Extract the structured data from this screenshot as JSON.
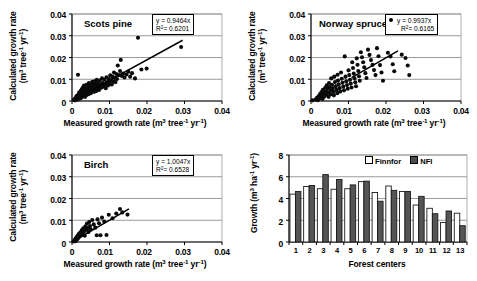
{
  "figure": {
    "panels": [
      "scots-pine",
      "norway-spruce",
      "birch",
      "forest-centers"
    ]
  },
  "common": {
    "xlabel_main": "Measured growth rate (m",
    "ylabel_line1": "Calculated growth rate",
    "ylabel_line2": "(m",
    "x_ticks": [
      "0",
      "0.01",
      "0.02",
      "0.03",
      "0.04"
    ],
    "y_ticks": [
      "0",
      "0.01",
      "0.02",
      "0.03",
      "0.04"
    ]
  },
  "chart_data": [
    {
      "type": "scatter",
      "name": "scots-pine",
      "title": "Scots pine",
      "xlabel": "Measured growth rate (m³ tree⁻¹ yr⁻¹)",
      "ylabel": "Calculated growth rate (m³ tree⁻¹ yr⁻¹)",
      "xlim": [
        0,
        0.04
      ],
      "ylim": [
        0,
        0.04
      ],
      "xticks": [
        0,
        0.01,
        0.02,
        0.03,
        0.04
      ],
      "yticks": [
        0,
        0.01,
        0.02,
        0.03,
        0.04
      ],
      "grid": true,
      "annotation": {
        "equation": "y  = 0.9464x",
        "r2": "R² = 0.6201",
        "marker": "none"
      },
      "fit_line": {
        "slope": 0.9464,
        "intercept": 0,
        "x_start": 0.0055,
        "x_end": 0.0295
      },
      "points": [
        [
          0.0005,
          0.0005
        ],
        [
          0.0007,
          0.0009
        ],
        [
          0.0008,
          0.0003
        ],
        [
          0.0009,
          0.0012
        ],
        [
          0.001,
          0.0006
        ],
        [
          0.0011,
          0.0018
        ],
        [
          0.0012,
          0.0009
        ],
        [
          0.0013,
          0.0024
        ],
        [
          0.0014,
          0.0014
        ],
        [
          0.0015,
          0.0007
        ],
        [
          0.0016,
          0.0121
        ],
        [
          0.0017,
          0.0029
        ],
        [
          0.0018,
          0.0017
        ],
        [
          0.0019,
          0.0039
        ],
        [
          0.002,
          0.0022
        ],
        [
          0.0021,
          0.0011
        ],
        [
          0.0022,
          0.0033
        ],
        [
          0.0023,
          0.0046
        ],
        [
          0.0024,
          0.0026
        ],
        [
          0.0025,
          0.0015
        ],
        [
          0.0026,
          0.0054
        ],
        [
          0.0027,
          0.0036
        ],
        [
          0.0028,
          0.0021
        ],
        [
          0.0029,
          0.0062
        ],
        [
          0.003,
          0.0043
        ],
        [
          0.0031,
          0.0028
        ],
        [
          0.0032,
          0.0071
        ],
        [
          0.0033,
          0.0051
        ],
        [
          0.0034,
          0.0034
        ],
        [
          0.0035,
          0.0019
        ],
        [
          0.0036,
          0.0061
        ],
        [
          0.0037,
          0.0044
        ],
        [
          0.0038,
          0.0027
        ],
        [
          0.0039,
          0.0075
        ],
        [
          0.004,
          0.0054
        ],
        [
          0.0041,
          0.0038
        ],
        [
          0.0042,
          0.0065
        ],
        [
          0.0043,
          0.0047
        ],
        [
          0.0044,
          0.0031
        ],
        [
          0.0045,
          0.0082
        ],
        [
          0.0046,
          0.0058
        ],
        [
          0.0047,
          0.0041
        ],
        [
          0.0048,
          0.0069
        ],
        [
          0.0049,
          0.0051
        ],
        [
          0.005,
          0.0036
        ],
        [
          0.0051,
          0.0076
        ],
        [
          0.0052,
          0.0057
        ],
        [
          0.0053,
          0.0044
        ],
        [
          0.0054,
          0.0088
        ],
        [
          0.0055,
          0.0064
        ],
        [
          0.0056,
          0.0049
        ],
        [
          0.0057,
          0.0079
        ],
        [
          0.0058,
          0.0059
        ],
        [
          0.0059,
          0.0042
        ],
        [
          0.006,
          0.0091
        ],
        [
          0.0061,
          0.0068
        ],
        [
          0.0062,
          0.0052
        ],
        [
          0.0063,
          0.0083
        ],
        [
          0.0064,
          0.0062
        ],
        [
          0.0065,
          0.0046
        ],
        [
          0.0066,
          0.0097
        ],
        [
          0.0067,
          0.0073
        ],
        [
          0.0068,
          0.0056
        ],
        [
          0.0069,
          0.0086
        ],
        [
          0.007,
          0.0066
        ],
        [
          0.0072,
          0.0051
        ],
        [
          0.0074,
          0.0094
        ],
        [
          0.0076,
          0.0077
        ],
        [
          0.0078,
          0.0061
        ],
        [
          0.008,
          0.0104
        ],
        [
          0.0082,
          0.0082
        ],
        [
          0.0084,
          0.0067
        ],
        [
          0.0086,
          0.0098
        ],
        [
          0.0088,
          0.0076
        ],
        [
          0.009,
          0.0059
        ],
        [
          0.0092,
          0.0109
        ],
        [
          0.0094,
          0.0087
        ],
        [
          0.0096,
          0.0071
        ],
        [
          0.0098,
          0.0102
        ],
        [
          0.01,
          0.0081
        ],
        [
          0.0102,
          0.0118
        ],
        [
          0.0104,
          0.0094
        ],
        [
          0.0106,
          0.0076
        ],
        [
          0.0108,
          0.0112
        ],
        [
          0.011,
          0.0089
        ],
        [
          0.0112,
          0.0131
        ],
        [
          0.0114,
          0.0106
        ],
        [
          0.0116,
          0.0087
        ],
        [
          0.0118,
          0.0124
        ],
        [
          0.012,
          0.0101
        ],
        [
          0.0122,
          0.0163
        ],
        [
          0.0125,
          0.0119
        ],
        [
          0.0128,
          0.0138
        ],
        [
          0.013,
          0.0189
        ],
        [
          0.0133,
          0.0115
        ],
        [
          0.0136,
          0.0126
        ],
        [
          0.014,
          0.0108
        ],
        [
          0.0145,
          0.0122
        ],
        [
          0.015,
          0.0135
        ],
        [
          0.0155,
          0.0112
        ],
        [
          0.016,
          0.0128
        ],
        [
          0.0168,
          0.0104
        ],
        [
          0.0176,
          0.0291
        ],
        [
          0.0185,
          0.0145
        ],
        [
          0.0199,
          0.0149
        ],
        [
          0.0291,
          0.0248
        ]
      ]
    },
    {
      "type": "scatter",
      "name": "norway-spruce",
      "title": "Norway spruce",
      "xlabel": "Measured growth rate (m³ tree⁻¹ yr⁻¹)",
      "ylabel": "Calculated growth rate (m³ tree⁻¹ yr⁻¹)",
      "xlim": [
        0,
        0.04
      ],
      "ylim": [
        0,
        0.04
      ],
      "xticks": [
        0,
        0.01,
        0.02,
        0.03,
        0.04
      ],
      "yticks": [
        0,
        0.01,
        0.02,
        0.03,
        0.04
      ],
      "grid": true,
      "annotation": {
        "equation": "y  = 0.9937x",
        "r2": "R² = 0.6165",
        "marker": "dot"
      },
      "fit_line": {
        "slope": 0.9937,
        "intercept": 0,
        "x_start": 0.0108,
        "x_end": 0.0232
      },
      "points": [
        [
          0.0004,
          0.0003
        ],
        [
          0.0012,
          0.0007
        ],
        [
          0.0016,
          0.0015
        ],
        [
          0.0018,
          0.0004
        ],
        [
          0.002,
          0.0022
        ],
        [
          0.0022,
          0.0011
        ],
        [
          0.0024,
          0.0032
        ],
        [
          0.0026,
          0.0018
        ],
        [
          0.0028,
          0.0041
        ],
        [
          0.003,
          0.0026
        ],
        [
          0.0031,
          0.0009
        ],
        [
          0.0032,
          0.0052
        ],
        [
          0.0034,
          0.0036
        ],
        [
          0.0036,
          0.0021
        ],
        [
          0.0038,
          0.0061
        ],
        [
          0.004,
          0.0044
        ],
        [
          0.0041,
          0.0029
        ],
        [
          0.0042,
          0.0072
        ],
        [
          0.0044,
          0.0056
        ],
        [
          0.0046,
          0.0038
        ],
        [
          0.0047,
          0.0019
        ],
        [
          0.0048,
          0.0083
        ],
        [
          0.005,
          0.0064
        ],
        [
          0.0052,
          0.0047
        ],
        [
          0.0053,
          0.0031
        ],
        [
          0.0054,
          0.0104
        ],
        [
          0.0056,
          0.0075
        ],
        [
          0.0058,
          0.0058
        ],
        [
          0.006,
          0.0042
        ],
        [
          0.0061,
          0.0026
        ],
        [
          0.0062,
          0.0112
        ],
        [
          0.0064,
          0.0087
        ],
        [
          0.0066,
          0.0068
        ],
        [
          0.0068,
          0.0051
        ],
        [
          0.007,
          0.0036
        ],
        [
          0.0071,
          0.0121
        ],
        [
          0.0072,
          0.0094
        ],
        [
          0.0074,
          0.0077
        ],
        [
          0.0076,
          0.0059
        ],
        [
          0.0078,
          0.0044
        ],
        [
          0.008,
          0.0131
        ],
        [
          0.0082,
          0.0102
        ],
        [
          0.0084,
          0.0084
        ],
        [
          0.0086,
          0.0066
        ],
        [
          0.0088,
          0.0049
        ],
        [
          0.009,
          0.0205
        ],
        [
          0.0092,
          0.0112
        ],
        [
          0.0094,
          0.0091
        ],
        [
          0.0096,
          0.0073
        ],
        [
          0.0098,
          0.0056
        ],
        [
          0.01,
          0.0141
        ],
        [
          0.0102,
          0.0119
        ],
        [
          0.0104,
          0.0098
        ],
        [
          0.0106,
          0.008
        ],
        [
          0.0108,
          0.0062
        ],
        [
          0.011,
          0.0178
        ],
        [
          0.0112,
          0.0152
        ],
        [
          0.0114,
          0.0126
        ],
        [
          0.0116,
          0.0104
        ],
        [
          0.0118,
          0.0086
        ],
        [
          0.012,
          0.0068
        ],
        [
          0.0122,
          0.0196
        ],
        [
          0.0124,
          0.0167
        ],
        [
          0.0126,
          0.0138
        ],
        [
          0.0128,
          0.0114
        ],
        [
          0.013,
          0.0093
        ],
        [
          0.0133,
          0.0224
        ],
        [
          0.0136,
          0.0201
        ],
        [
          0.0139,
          0.0178
        ],
        [
          0.0142,
          0.0155
        ],
        [
          0.0145,
          0.0128
        ],
        [
          0.0148,
          0.0106
        ],
        [
          0.0152,
          0.0236
        ],
        [
          0.0156,
          0.0212
        ],
        [
          0.016,
          0.0188
        ],
        [
          0.0164,
          0.0166
        ],
        [
          0.0168,
          0.0142
        ],
        [
          0.0172,
          0.0119
        ],
        [
          0.0176,
          0.0243
        ],
        [
          0.018,
          0.0206
        ],
        [
          0.0184,
          0.0165
        ],
        [
          0.0188,
          0.0131
        ],
        [
          0.0192,
          0.0093
        ],
        [
          0.0205,
          0.0222
        ],
        [
          0.0212,
          0.0205
        ],
        [
          0.0218,
          0.0169
        ],
        [
          0.0222,
          0.0137
        ],
        [
          0.0242,
          0.0213
        ],
        [
          0.0252,
          0.0198
        ],
        [
          0.0258,
          0.0163
        ],
        [
          0.0262,
          0.0119
        ]
      ]
    },
    {
      "type": "scatter",
      "name": "birch",
      "title": "Birch",
      "xlabel": "Measured growth rate (m³ tree⁻¹ yr⁻¹)",
      "ylabel": "Calculated growth rate (m³ tree⁻¹ yr⁻¹)",
      "xlim": [
        0,
        0.04
      ],
      "ylim": [
        0,
        0.04
      ],
      "xticks": [
        0,
        0.01,
        0.02,
        0.03,
        0.04
      ],
      "yticks": [
        0,
        0.01,
        0.02,
        0.03,
        0.04
      ],
      "grid": true,
      "annotation": {
        "equation": "y  = 1.0047x",
        "r2": "R² = 0.6528",
        "marker": "none"
      },
      "fit_line": {
        "slope": 1.0047,
        "intercept": 0,
        "x_start": 0.0012,
        "x_end": 0.0152
      },
      "points": [
        [
          0.0004,
          0.0002
        ],
        [
          0.0006,
          0.0006
        ],
        [
          0.0008,
          0.0011
        ],
        [
          0.0009,
          0.0004
        ],
        [
          0.001,
          0.0016
        ],
        [
          0.0011,
          0.0008
        ],
        [
          0.0012,
          0.0022
        ],
        [
          0.0014,
          0.0013
        ],
        [
          0.0015,
          0.0029
        ],
        [
          0.0016,
          0.0018
        ],
        [
          0.0018,
          0.0036
        ],
        [
          0.002,
          0.0024
        ],
        [
          0.0022,
          0.0044
        ],
        [
          0.0024,
          0.0031
        ],
        [
          0.0026,
          0.0054
        ],
        [
          0.0028,
          0.004
        ],
        [
          0.003,
          0.0063
        ],
        [
          0.0032,
          0.0047
        ],
        [
          0.0034,
          0.0029
        ],
        [
          0.0036,
          0.0072
        ],
        [
          0.0038,
          0.0056
        ],
        [
          0.004,
          0.0085
        ],
        [
          0.0042,
          0.0064
        ],
        [
          0.0044,
          0.0046
        ],
        [
          0.0046,
          0.0092
        ],
        [
          0.0048,
          0.0073
        ],
        [
          0.005,
          0.0058
        ],
        [
          0.0054,
          0.0101
        ],
        [
          0.0058,
          0.0081
        ],
        [
          0.0062,
          0.0066
        ],
        [
          0.0066,
          0.0031
        ],
        [
          0.0068,
          0.0104
        ],
        [
          0.0072,
          0.0086
        ],
        [
          0.0076,
          0.0031
        ],
        [
          0.008,
          0.0112
        ],
        [
          0.0086,
          0.0094
        ],
        [
          0.0092,
          0.0032
        ],
        [
          0.0098,
          0.0125
        ],
        [
          0.0108,
          0.0109
        ],
        [
          0.0118,
          0.0131
        ],
        [
          0.0128,
          0.0152
        ],
        [
          0.0134,
          0.0136
        ],
        [
          0.0148,
          0.0126
        ]
      ]
    },
    {
      "type": "bar",
      "name": "forest-centers",
      "title": "",
      "xlabel": "Forest centers",
      "ylabel": "Growth (m³ ha⁻¹ yr⁻¹)",
      "categories": [
        "1",
        "2",
        "3",
        "4",
        "5",
        "6",
        "7",
        "8",
        "9",
        "10",
        "11",
        "12",
        "13"
      ],
      "ylim": [
        0,
        8
      ],
      "yticks": [
        0,
        2,
        4,
        6,
        8
      ],
      "grid": true,
      "legend_position": "top-right",
      "series": [
        {
          "name": "Finnfor",
          "style": "open",
          "values": [
            4.4,
            5.1,
            4.9,
            4.85,
            4.9,
            5.55,
            4.55,
            5.15,
            4.65,
            3.4,
            3.1,
            1.8,
            2.65
          ]
        },
        {
          "name": "NFI",
          "style": "filled",
          "values": [
            4.65,
            5.2,
            6.2,
            5.75,
            5.25,
            5.6,
            3.75,
            4.75,
            4.65,
            4.2,
            2.6,
            2.85,
            1.5
          ]
        }
      ]
    }
  ],
  "labels": {
    "legend_finnfor": "Finnfor",
    "legend_nfi": "NFI",
    "bar_xlabel": "Forest centers",
    "bar_ylabel_prefix": "Growth (m",
    "bar_yticks": [
      "0",
      "2",
      "4",
      "6",
      "8"
    ],
    "bar_xticks": [
      "1",
      "2",
      "3",
      "4",
      "5",
      "6",
      "7",
      "8",
      "9",
      "10",
      "11",
      "12",
      "13"
    ]
  }
}
